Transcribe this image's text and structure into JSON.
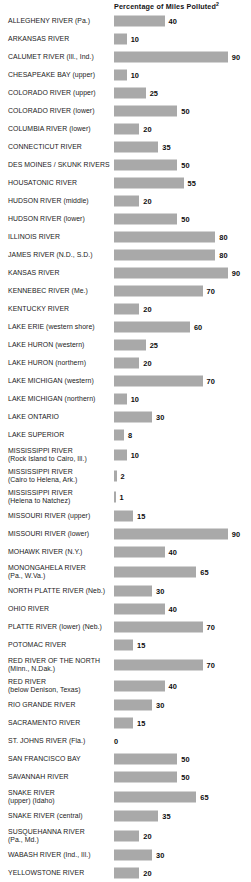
{
  "chart_data": {
    "type": "bar",
    "title": "Percentage of Miles Polluted",
    "title_superscript": "2",
    "orientation": "horizontal",
    "xlabel": "",
    "ylabel": "",
    "xlim": [
      0,
      100
    ],
    "grid": false,
    "legend": "none",
    "unit": "percent",
    "categories": [
      "ALLEGHENY RIVER (Pa.)",
      "ARKANSAS RIVER",
      "CALUMET RIVER (Ill., Ind.)",
      "CHESAPEAKE BAY (upper)",
      "COLORADO RIVER (upper)",
      "COLORADO RIVER (lower)",
      "COLUMBIA RIVER (lower)",
      "CONNECTICUT RIVER",
      "DES MOINES / SKUNK RIVERS",
      "HOUSATONIC RIVER",
      "HUDSON RIVER (middle)",
      "HUDSON RIVER (lower)",
      "ILLINOIS RIVER",
      "JAMES RIVER (N.D., S.D.)",
      "KANSAS RIVER",
      "KENNEBEC RIVER (Me.)",
      "KENTUCKY RIVER",
      "LAKE ERIE (western shore)",
      "LAKE HURON (western)",
      "LAKE HURON (northern)",
      "LAKE MICHIGAN (western)",
      "LAKE MICHIGAN (northern)",
      "LAKE ONTARIO",
      "LAKE SUPERIOR",
      "MISSISSIPPI RIVER\n(Rock Island to Cairo, Ill.)",
      "MISSISSIPPI RIVER\n(Cairo to Helena, Ark.)",
      "MISSISSIPPI RIVER\n(Helena to Natchez)",
      "MISSOURI RIVER (upper)",
      "MISSOURI RIVER (lower)",
      "MOHAWK RIVER (N.Y.)",
      "MONONGAHELA RIVER\n(Pa., W.Va.)",
      "NORTH PLATTE RIVER (Neb.)",
      "OHIO RIVER",
      "PLATTE RIVER (lower) (Neb.)",
      "POTOMAC RIVER",
      "RED RIVER OF THE NORTH\n(Minn., N.Dak.)",
      "RED RIVER\n(below Denison, Texas)",
      "RIO GRANDE RIVER",
      "SACRAMENTO RIVER",
      "ST. JOHNS RIVER (Fla.)",
      "SAN FRANCISCO BAY",
      "SAVANNAH RIVER",
      "SNAKE RIVER\n(upper) (Idaho)",
      "SNAKE RIVER (central)",
      "SUSQUEHANNA RIVER\n(Pa., Md.)",
      "WABASH RIVER (Ind., Ill.)",
      "YELLOWSTONE RIVER"
    ],
    "values": [
      40,
      10,
      90,
      10,
      25,
      50,
      20,
      35,
      50,
      55,
      20,
      50,
      80,
      80,
      90,
      70,
      20,
      60,
      25,
      20,
      70,
      10,
      30,
      8,
      10,
      2,
      1,
      15,
      90,
      40,
      65,
      30,
      40,
      70,
      15,
      70,
      40,
      30,
      15,
      0,
      50,
      50,
      65,
      35,
      20,
      30,
      20
    ],
    "value_labels": [
      "40",
      "10",
      "90",
      "10",
      "25",
      "50",
      "20",
      "35",
      "50",
      "55",
      "20",
      "50",
      "80",
      "80",
      "90",
      "70",
      "20",
      "60",
      "25",
      "20",
      "70",
      "10",
      "30",
      "8",
      "10",
      "2",
      "1",
      "15",
      "90",
      "40",
      "65",
      "30",
      "40",
      "70",
      "15",
      "70",
      "40",
      "30",
      "15",
      "0",
      "50",
      "50",
      "65",
      "35",
      "20",
      "30",
      "20"
    ],
    "bar_color": "#a9a9a9",
    "text_color": "#1a1a1a",
    "background_color": "#ffffff"
  }
}
